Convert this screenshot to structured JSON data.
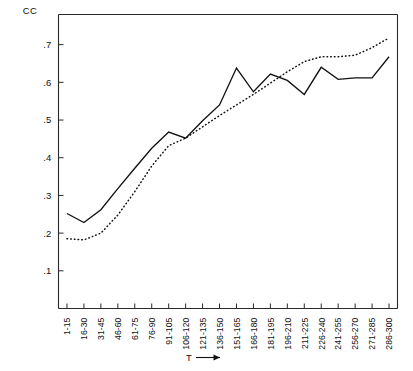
{
  "chart_data": {
    "type": "line",
    "title": "",
    "ylabel": "CC",
    "xlabel": "T",
    "ylim": [
      0.0,
      0.78
    ],
    "yticks": [
      0.1,
      0.2,
      0.3,
      0.4,
      0.5,
      0.6,
      0.7
    ],
    "ytick_labels": [
      ".1",
      ".2",
      ".3",
      ".4",
      ".5",
      ".6",
      ".7"
    ],
    "grid": false,
    "legend": "none",
    "categories": [
      "1-15",
      "16-30",
      "31-45",
      "46-60",
      "61-75",
      "76-90",
      "91-105",
      "106-120",
      "121-135",
      "136-150",
      "151-165",
      "166-180",
      "181-195",
      "196-210",
      "211-225",
      "226-240",
      "241-255",
      "256-270",
      "271-285",
      "286-300"
    ],
    "series": [
      {
        "name": "solid",
        "style": "solid",
        "values": [
          0.252,
          0.228,
          0.262,
          0.318,
          0.372,
          0.425,
          0.468,
          0.452,
          0.498,
          0.54,
          0.638,
          0.575,
          0.622,
          0.605,
          0.568,
          0.64,
          0.608,
          0.612,
          0.612,
          0.668
        ]
      },
      {
        "name": "dotted",
        "style": "dotted",
        "values": [
          0.185,
          0.182,
          0.2,
          0.248,
          0.31,
          0.378,
          0.432,
          0.452,
          0.482,
          0.512,
          0.54,
          0.568,
          0.598,
          0.628,
          0.655,
          0.668,
          0.668,
          0.672,
          0.692,
          0.718
        ]
      }
    ]
  }
}
